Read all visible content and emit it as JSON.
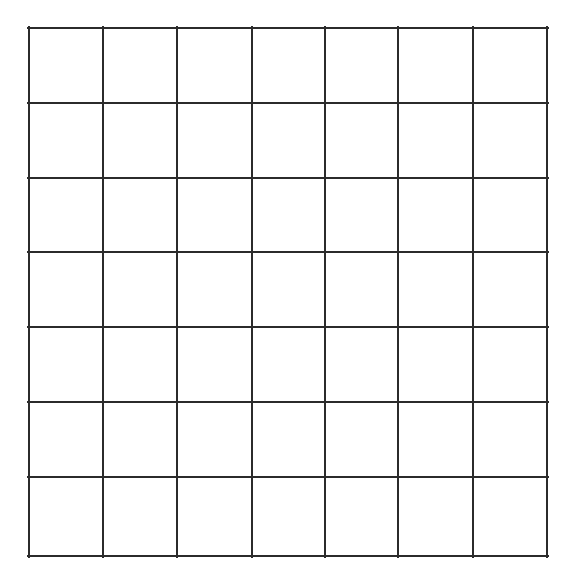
{
  "page": {
    "background_color": "#ffffff",
    "width": 573,
    "height": 582
  },
  "figure": {
    "name": "grid",
    "rows": 7,
    "columns": 7,
    "total_cells": 49,
    "line_color": "#2b2b2b",
    "line_width": 2,
    "cell_fill_color": "#ffffff",
    "origin_x": 29,
    "origin_y": 28,
    "grid_width": 519,
    "grid_height": 528,
    "column_edges": [
      0,
      74,
      148,
      223,
      296,
      369,
      444,
      518
    ],
    "row_edges": [
      0,
      75,
      150,
      224,
      299,
      374,
      449,
      528
    ],
    "cell_labels": [
      [
        "",
        "",
        "",
        "",
        "",
        "",
        ""
      ],
      [
        "",
        "",
        "",
        "",
        "",
        "",
        ""
      ],
      [
        "",
        "",
        "",
        "",
        "",
        "",
        ""
      ],
      [
        "",
        "",
        "",
        "",
        "",
        "",
        ""
      ],
      [
        "",
        "",
        "",
        "",
        "",
        "",
        ""
      ],
      [
        "",
        "",
        "",
        "",
        "",
        "",
        ""
      ],
      [
        "",
        "",
        "",
        "",
        "",
        "",
        ""
      ]
    ]
  },
  "chart_data": {
    "type": "table",
    "title": "",
    "xlabel": "",
    "ylabel": "",
    "columns": [
      "",
      "",
      "",
      "",
      "",
      "",
      ""
    ],
    "rows": [
      [
        "",
        "",
        "",
        "",
        "",
        "",
        ""
      ],
      [
        "",
        "",
        "",
        "",
        "",
        "",
        ""
      ],
      [
        "",
        "",
        "",
        "",
        "",
        "",
        ""
      ],
      [
        "",
        "",
        "",
        "",
        "",
        "",
        ""
      ],
      [
        "",
        "",
        "",
        "",
        "",
        "",
        ""
      ],
      [
        "",
        "",
        "",
        "",
        "",
        "",
        ""
      ],
      [
        "",
        "",
        "",
        "",
        "",
        "",
        ""
      ]
    ],
    "grid": true,
    "legend": "none"
  }
}
